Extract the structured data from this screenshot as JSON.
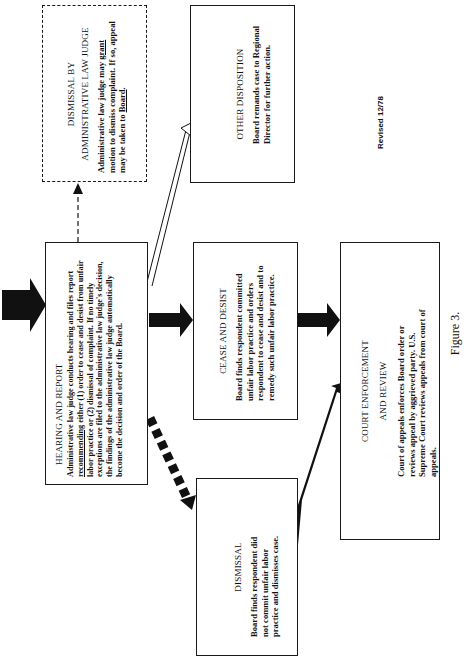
{
  "figure": {
    "caption": "Figure 3.",
    "revision_note": "Revised 12/78"
  },
  "boxes": {
    "alj_dismissal": {
      "title_line1": "DISMISSAL BY",
      "title_line2": "ADMINISTRATIVE LAW JUDGE",
      "body_pre": "Administrative law judge may ",
      "body_u1": "grant",
      "body_mid": " motion to dismiss complaint.  If so, appeal may be taken to ",
      "body_u2": "Board",
      "body_post": "."
    },
    "hearing_report": {
      "title": "HEARING AND REPORT",
      "body_pre": "Administrative law judge conducts hearing and files report ",
      "body_u1": "recommending",
      "body_mid": " either (1)  order to cease and desist from unfair labor practice or (2)  dismissal of complaint.   If no timely exceptions are filed to the administrative law judge's decision, the findings of the administrative law judge automatically become the decision and order of the Board."
    },
    "other_disposition": {
      "title": "OTHER DISPOSITION",
      "body": "Board remands case to Regional Director for further action."
    },
    "cease_desist": {
      "title": "CEASE AND DESIST",
      "body": "Board finds respondent committed unfair labor practice and orders respondent to cease and desist and to remedy such unfair labor practice."
    },
    "court_enforcement": {
      "title_line1": "COURT ENFORCEMENT",
      "title_line2": "AND REVIEW",
      "body": "Court of appeals enforces Board order or reviews appeal by aggrieved party.  U.S. Supreme Court reviews appeals from court of appeals."
    },
    "dismissal": {
      "title": "DISMISSAL",
      "body": "Board finds respondent did not commit unfair labor practice and dismisses case."
    }
  },
  "connectors": [
    {
      "from": "previous-step",
      "to": "hearing_report",
      "style": "solid-thick"
    },
    {
      "from": "hearing_report",
      "to": "alj_dismissal",
      "style": "dashed-thin"
    },
    {
      "from": "hearing_report",
      "to": "other_disposition",
      "style": "hollow"
    },
    {
      "from": "hearing_report",
      "to": "cease_desist",
      "style": "solid-thick"
    },
    {
      "from": "hearing_report",
      "to": "dismissal",
      "style": "dashed-thick"
    },
    {
      "from": "cease_desist",
      "to": "court_enforcement",
      "style": "solid-thick"
    },
    {
      "from": "dismissal",
      "to": "court_enforcement",
      "style": "solid-thick"
    }
  ],
  "colors": {
    "ink": "#1a1a1a",
    "paper": "#ffffff"
  }
}
